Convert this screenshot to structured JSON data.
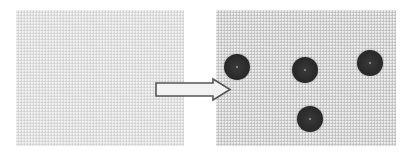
{
  "diagram": {
    "panels": [
      {
        "id": "before",
        "label": "",
        "contents": "blank textured gray surface"
      },
      {
        "id": "after",
        "label": "",
        "contents": "textured gray surface with four dark dots"
      }
    ],
    "arrow": {
      "direction": "right",
      "from": "before",
      "to": "after"
    },
    "dots": [
      {
        "x": 237,
        "y": 67
      },
      {
        "x": 305,
        "y": 70
      },
      {
        "x": 370,
        "y": 63
      },
      {
        "x": 310,
        "y": 119
      }
    ],
    "colors": {
      "background": "#ffffff",
      "panel_before": "#e1e1e1",
      "panel_after": "#d3d3d3",
      "dot": "#2a2a2a",
      "arrow_fill": "#f2f2f2",
      "arrow_stroke": "#555555"
    }
  }
}
